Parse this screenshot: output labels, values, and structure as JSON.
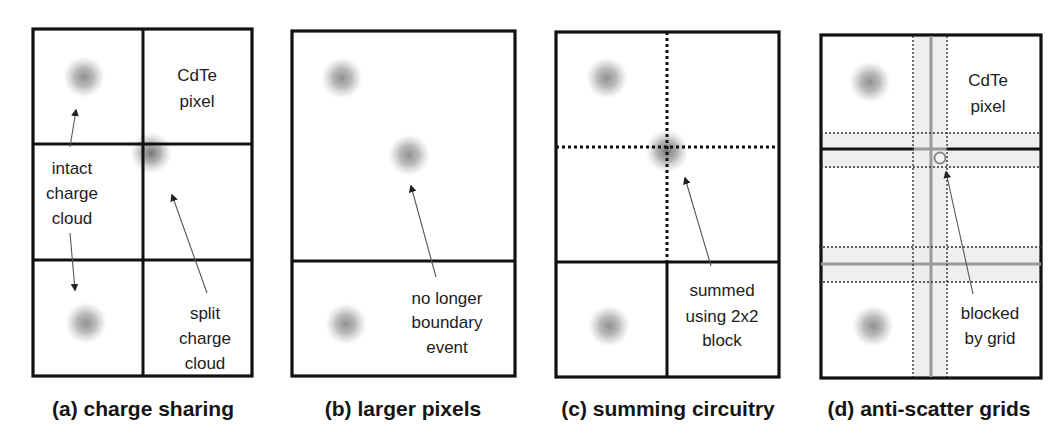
{
  "figure": {
    "panels": [
      {
        "id": "a",
        "caption": "(a) charge sharing",
        "labels": {
          "pixel_line1": "CdTe",
          "pixel_line2": "pixel",
          "intact_line1": "intact",
          "intact_line2": "charge",
          "intact_line3": "cloud",
          "split_line1": "split",
          "split_line2": "charge",
          "split_line3": "cloud"
        },
        "grid": "2 columns x 3 rows of pixels",
        "charge_clouds": 3
      },
      {
        "id": "b",
        "caption": "(b) larger pixels",
        "labels": {
          "line1": "no longer",
          "line2": "boundary",
          "line3": "event"
        },
        "grid": "1 large pixel over 1 pixel row",
        "charge_clouds": 3
      },
      {
        "id": "c",
        "caption": "(c) summing circuitry",
        "labels": {
          "line1": "summed",
          "line2": "using 2x2",
          "line3": "block"
        },
        "grid": "2x2 block (dotted internal lines) over 2 pixels",
        "charge_clouds": 3
      },
      {
        "id": "d",
        "caption": "(d) anti-scatter grids",
        "labels": {
          "pixel_line1": "CdTe",
          "pixel_line2": "pixel",
          "blocked_line1": "blocked",
          "blocked_line2": "by grid"
        },
        "grid": "2x3 pixels with anti-scatter grid septa bands",
        "charge_clouds": 2
      }
    ],
    "colors": {
      "line": "#111111",
      "cloud": "#8c8c8c",
      "grid_band": "#ececec",
      "grid_center": "#9a9a9a",
      "arrow": "#555555"
    }
  }
}
